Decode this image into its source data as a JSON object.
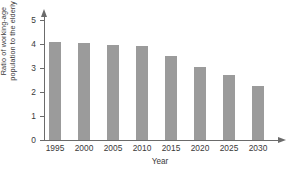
{
  "chart_data": {
    "type": "bar",
    "title": "",
    "xlabel": "Year",
    "ylabel_lines": [
      "Ratio of working-age",
      "population to the elderly"
    ],
    "ylabel": "Ratio of working-age population to the elderly",
    "categories": [
      "1995",
      "2000",
      "2005",
      "2010",
      "2015",
      "2020",
      "2025",
      "2030"
    ],
    "values": [
      4.1,
      4.05,
      3.95,
      3.9,
      3.5,
      3.05,
      2.7,
      2.25
    ],
    "ylim": [
      0,
      5
    ],
    "ytick_labels": [
      "0",
      "1",
      "2",
      "3",
      "4",
      "5"
    ],
    "ytick_values": [
      0,
      1,
      2,
      3,
      4,
      5
    ],
    "grid": false,
    "legend": "none",
    "bar_color": "#9b9b9b",
    "axis_color": "#6b6b6b",
    "background_color": "#ffffff"
  }
}
